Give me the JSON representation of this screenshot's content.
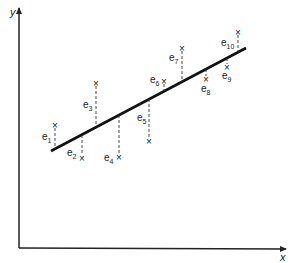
{
  "axes": {
    "x_label": "x",
    "y_label": "y"
  },
  "colors": {
    "ink": "#222222",
    "background": "#ffffff"
  },
  "regression_line": {
    "x1": 51,
    "y1": 151,
    "x2": 246,
    "y2": 48
  },
  "points": [
    {
      "label": "e",
      "sub": "1",
      "px": 55,
      "py": 125,
      "side": "above"
    },
    {
      "label": "e",
      "sub": "2",
      "px": 82,
      "py": 158,
      "side": "below"
    },
    {
      "label": "e",
      "sub": "3",
      "px": 96,
      "py": 83,
      "side": "above"
    },
    {
      "label": "e",
      "sub": "4",
      "px": 119,
      "py": 157,
      "side": "below"
    },
    {
      "label": "e",
      "sub": "5",
      "px": 149,
      "py": 141,
      "side": "below"
    },
    {
      "label": "e",
      "sub": "6",
      "px": 164,
      "py": 81,
      "side": "above"
    },
    {
      "label": "e",
      "sub": "7",
      "px": 182,
      "py": 48,
      "side": "above"
    },
    {
      "label": "e",
      "sub": "8",
      "px": 206,
      "py": 79,
      "side": "below"
    },
    {
      "label": "e",
      "sub": "9",
      "px": 227,
      "py": 67,
      "side": "below"
    },
    {
      "label": "e",
      "sub": "10",
      "px": 238,
      "py": 32,
      "side": "above"
    }
  ],
  "labels": {
    "e1": "e",
    "e1_sub": "1",
    "e2": "e",
    "e2_sub": "2",
    "e3": "e",
    "e3_sub": "3",
    "e4": "e",
    "e4_sub": "4",
    "e5": "e",
    "e5_sub": "5",
    "e6": "e",
    "e6_sub": "6",
    "e7": "e",
    "e7_sub": "7",
    "e8": "e",
    "e8_sub": "8",
    "e9": "e",
    "e9_sub": "9",
    "e10": "e",
    "e10_sub": "10",
    "marker": "×"
  }
}
